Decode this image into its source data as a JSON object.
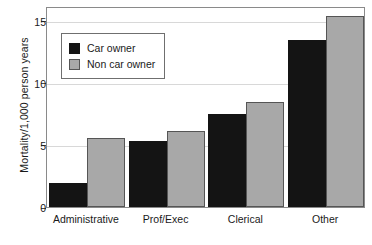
{
  "chart_data": {
    "type": "bar",
    "title": "",
    "xlabel": "",
    "ylabel": "Mortality/1,000 person years",
    "categories": [
      "Administrative",
      "Prof/Exec",
      "Clerical",
      "Other"
    ],
    "series": [
      {
        "name": "Car owner",
        "color": "#141414",
        "values": [
          1.9,
          5.3,
          7.5,
          13.5
        ]
      },
      {
        "name": "Non car owner",
        "color": "#a8a8a8",
        "values": [
          5.6,
          6.15,
          8.5,
          15.4
        ]
      }
    ],
    "ylim": [
      0,
      16.2
    ],
    "yticks": [
      0,
      5,
      10,
      15
    ],
    "ytick_labels": [
      "0",
      "5",
      "10",
      "15"
    ],
    "grid": true,
    "legend_position": "upper left"
  },
  "legend": {
    "items": [
      {
        "label": "Car owner",
        "swatch": "black-square-swatch"
      },
      {
        "label": "Non car owner",
        "swatch": "gray-square-swatch"
      }
    ]
  }
}
